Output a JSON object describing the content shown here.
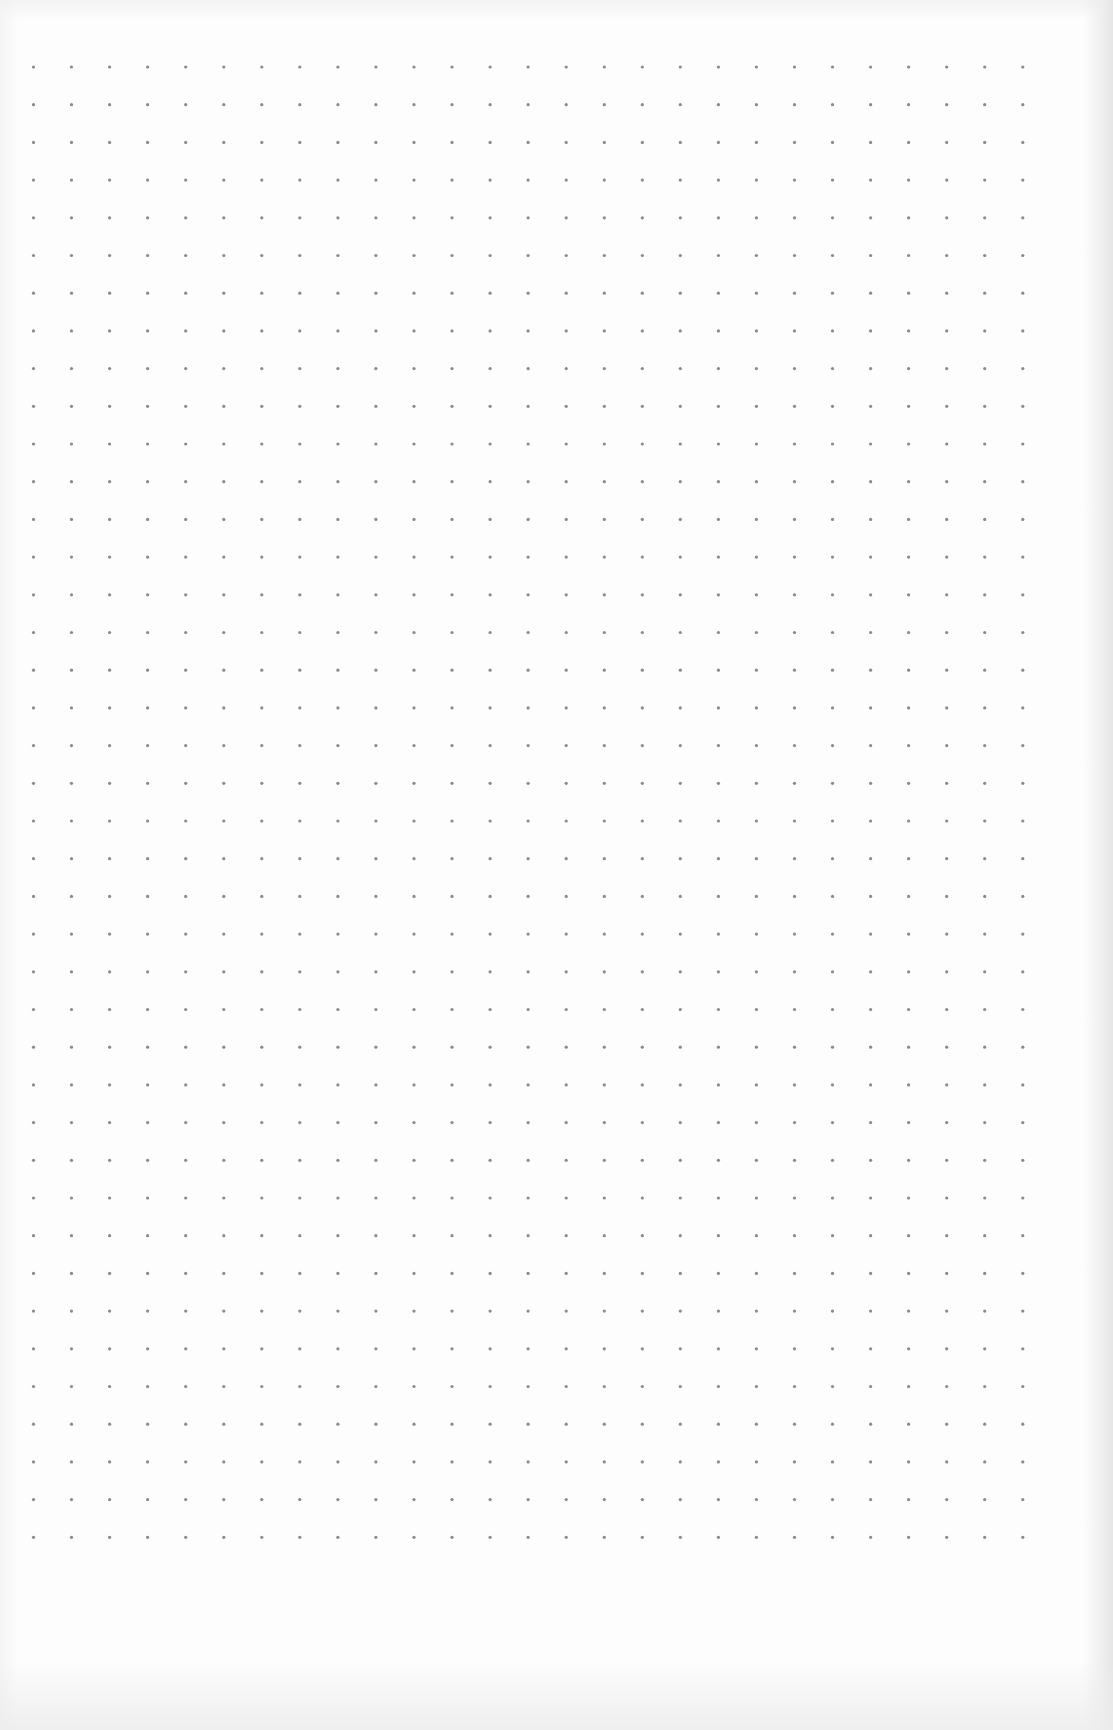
{
  "page": {
    "type": "dot-grid paper",
    "width": 1113,
    "height": 1730,
    "background_color": "#fdfdfd"
  },
  "grid": {
    "columns": 27,
    "rows": 40,
    "origin_x": 33.5,
    "origin_y": 67,
    "spacing_x": 38.05,
    "spacing_y": 37.7,
    "dot_radius": 1.6,
    "dot_color": "#8a8a8a"
  }
}
